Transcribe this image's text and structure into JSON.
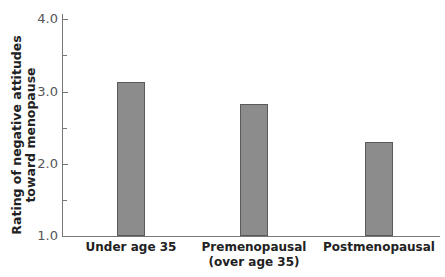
{
  "chart_data": {
    "type": "bar",
    "title": "",
    "xlabel": "",
    "ylabel": "Rating of negative attitudes toward menopause",
    "ylabel_lines": [
      "Rating of negative attitudes",
      "toward menopause"
    ],
    "categories": [
      "Under age 35",
      "Premenopausal (over age 35)",
      "Postmenopausal"
    ],
    "category_lines": [
      [
        "Under age 35"
      ],
      [
        "Premenopausal",
        "(over age 35)"
      ],
      [
        "Postmenopausal"
      ]
    ],
    "values": [
      3.13,
      2.83,
      2.3
    ],
    "ylim": [
      1.0,
      4.0
    ],
    "yticks": [
      "1.0",
      "2.0",
      "3.0",
      "4.0"
    ],
    "minor_ticks": [
      1.5,
      2.5,
      3.5
    ],
    "grid": false,
    "legend": null,
    "bar_color": "#8c8c8c",
    "bar_edge_color": "#5a5a5a"
  }
}
